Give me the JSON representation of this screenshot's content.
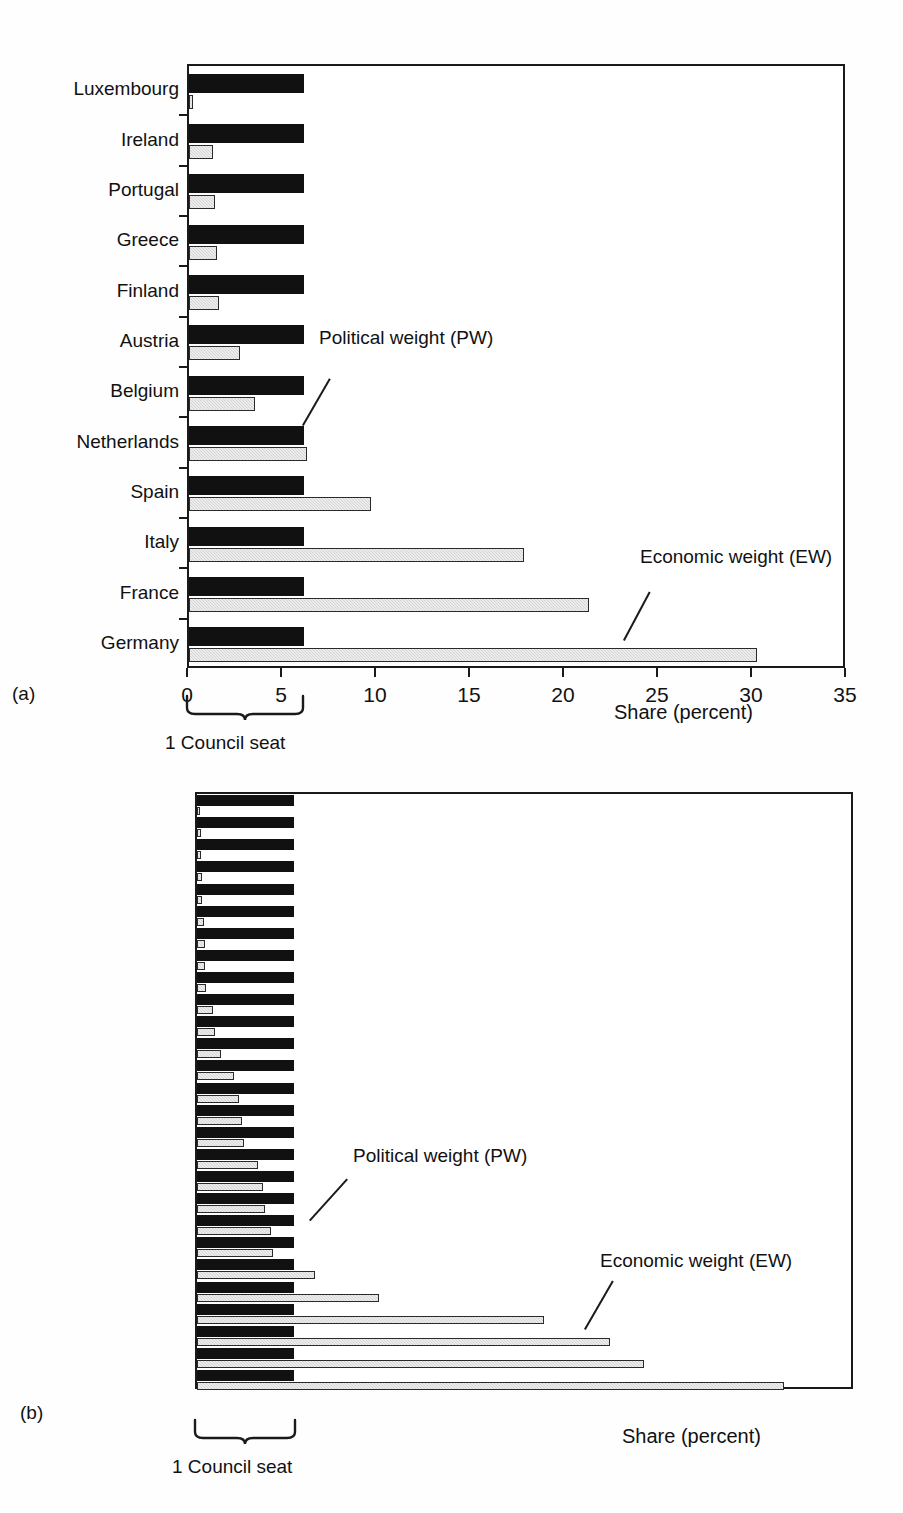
{
  "figure": {
    "panels": [
      {
        "letter": "(a)",
        "xlabel": "Share (percent)",
        "brace_label": "1 Council seat",
        "annotations": [
          {
            "name": "political-weight",
            "text": "Political weight (PW)"
          },
          {
            "name": "economic-weight",
            "text": "Economic weight (EW)"
          }
        ]
      },
      {
        "letter": "(b)",
        "xlabel": "Share (percent)",
        "brace_label": "1 Council seat",
        "annotations": [
          {
            "name": "political-weight",
            "text": "Political weight (PW)"
          },
          {
            "name": "economic-weight",
            "text": "Economic weight (EW)"
          }
        ]
      }
    ]
  },
  "chart_data": [
    {
      "id": "panel-a",
      "type": "bar",
      "orientation": "horizontal",
      "title": "(a)",
      "xlabel": "Share (percent)",
      "ylabel": "",
      "xlim": [
        0,
        35
      ],
      "xticks": [
        0,
        5,
        10,
        15,
        20,
        25,
        30,
        35
      ],
      "xticklabels": [
        "0",
        "5",
        "10",
        "15",
        "20",
        "25",
        "30",
        "35"
      ],
      "grid": false,
      "legend": "annotated-callouts",
      "legend_entries": [
        "Political weight (PW)",
        "Economic weight (EW)"
      ],
      "annotations": [
        "Political weight (PW)",
        "Economic weight (EW)",
        "1 Council seat"
      ],
      "categories": [
        "Germany",
        "France",
        "Italy",
        "Spain",
        "Netherlands",
        "Belgium",
        "Austria",
        "Finland",
        "Greece",
        "Portugal",
        "Ireland",
        "Luxembourg"
      ],
      "series": [
        {
          "name": "Political weight (PW)",
          "color": "#111111",
          "values": [
            6.1,
            6.1,
            6.1,
            6.1,
            6.1,
            6.1,
            6.1,
            6.1,
            6.1,
            6.1,
            6.1,
            6.1
          ]
        },
        {
          "name": "Economic weight (EW)",
          "color": "#d4d4d4",
          "values": [
            30.2,
            21.3,
            17.8,
            9.7,
            6.3,
            3.5,
            2.7,
            1.6,
            1.5,
            1.4,
            1.3,
            0.2
          ]
        }
      ]
    },
    {
      "id": "panel-b",
      "type": "bar",
      "orientation": "horizontal",
      "title": "(b)",
      "xlabel": "Share (percent)",
      "ylabel": "",
      "xlim": [
        0,
        25
      ],
      "xticks": [
        0,
        5,
        10,
        15,
        20,
        25
      ],
      "xticklabels": [
        "0",
        "5",
        "10",
        "15",
        "20",
        "25"
      ],
      "grid": false,
      "legend": "annotated-callouts",
      "legend_entries": [
        "Political weight (PW)",
        "Economic weight (EW)"
      ],
      "annotations": [
        "Political weight (PW)",
        "Economic weight (EW)",
        "1 Council seat"
      ],
      "categories": [
        "Germany",
        "United Kingdom",
        "France",
        "Italy",
        "Spain",
        "Netherlands",
        "Sweden",
        "Belgium",
        "Austria",
        "Poland",
        "Denmark",
        "Finland",
        "Greece",
        "Portugal",
        "Ireland",
        "Czech Republic",
        "Hungary",
        "Romania",
        "Slovakia",
        "Luxembourg",
        "Slovenia",
        "Bulgaria",
        "Lithuania",
        "Cyprus",
        "Latvia",
        "Estonia",
        "Malta"
      ],
      "series": [
        {
          "name": "Political weight (PW)",
          "color": "#111111",
          "values": [
            3.7,
            3.7,
            3.7,
            3.7,
            3.7,
            3.7,
            3.7,
            3.7,
            3.7,
            3.7,
            3.7,
            3.7,
            3.7,
            3.7,
            3.7,
            3.7,
            3.7,
            3.7,
            3.7,
            3.7,
            3.7,
            3.7,
            3.7,
            3.7,
            3.7,
            3.7,
            3.7
          ]
        },
        {
          "name": "Economic weight (EW)",
          "color": "#d4d4d4",
          "values": [
            22.3,
            17.0,
            15.7,
            13.2,
            6.9,
            4.5,
            2.9,
            2.8,
            2.6,
            2.5,
            2.3,
            1.8,
            1.7,
            1.6,
            1.4,
            0.9,
            0.7,
            0.6,
            0.35,
            0.3,
            0.3,
            0.25,
            0.2,
            0.2,
            0.15,
            0.15,
            0.1
          ]
        }
      ]
    }
  ]
}
